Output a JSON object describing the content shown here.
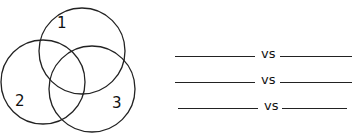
{
  "venn": {
    "circles": [
      {
        "label": "1",
        "cx": 82,
        "cy": 51,
        "r": 43
      },
      {
        "label": "2",
        "cx": 43,
        "cy": 82,
        "r": 42
      },
      {
        "label": "3",
        "cx": 92,
        "cy": 89,
        "r": 43
      }
    ],
    "stroke": "#222222"
  },
  "comparisons": [
    {
      "left": "",
      "sep": "vs",
      "right": ""
    },
    {
      "left": "",
      "sep": "vs",
      "right": ""
    },
    {
      "left": "",
      "sep": "vs",
      "right": ""
    }
  ]
}
